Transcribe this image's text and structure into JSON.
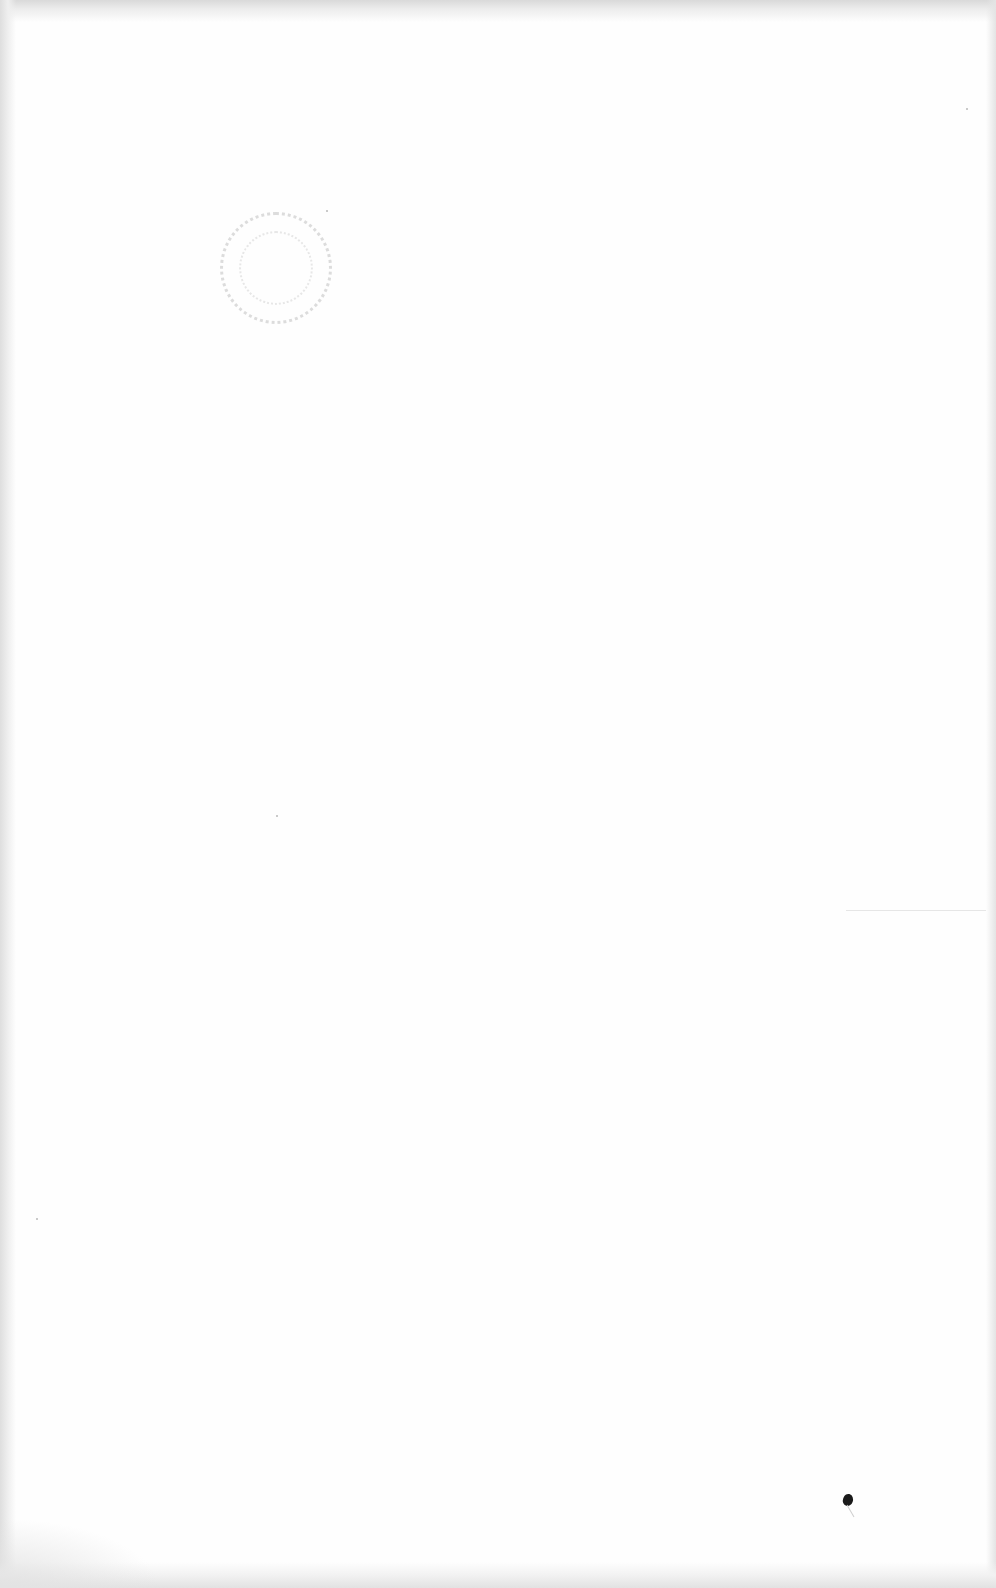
{
  "document": {
    "type": "blank scanned page",
    "text_content": "",
    "artifacts": {
      "circular_stamp": {
        "x": 275,
        "y": 268,
        "diameter": 112,
        "legible_text": ""
      },
      "speck": {
        "x": 848,
        "y": 1500
      },
      "horizontal_line": {
        "x": 846,
        "y": 910,
        "width": 140
      }
    }
  }
}
